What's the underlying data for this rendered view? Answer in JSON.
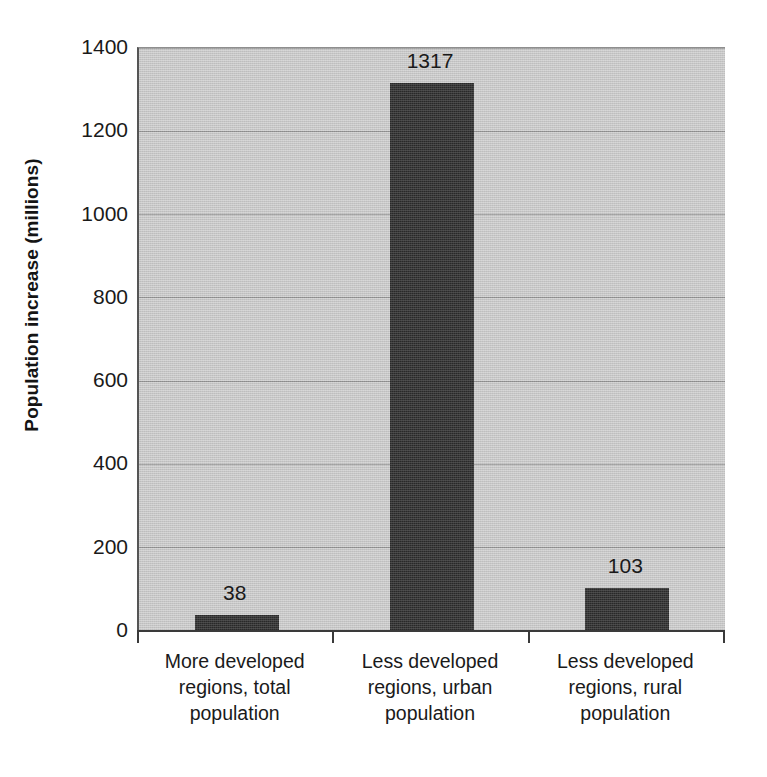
{
  "chart_data": {
    "type": "bar",
    "title": "",
    "subtitle": "",
    "xlabel": "",
    "ylabel": "Population increase (millions)",
    "categories": [
      "More developed regions, total population",
      "Less developed regions, urban population",
      "Less developed regions, rural population"
    ],
    "category_lines": [
      [
        "More developed",
        "regions, total",
        "population"
      ],
      [
        "Less developed",
        "regions, urban",
        "population"
      ],
      [
        "Less developed",
        "regions, rural",
        "population"
      ]
    ],
    "values": [
      38,
      1317,
      103
    ],
    "value_labels": [
      "38",
      "1317",
      "103"
    ],
    "ylim": [
      0,
      1400
    ],
    "ytick_values": [
      0,
      200,
      400,
      600,
      800,
      1000,
      1200,
      1400
    ],
    "ytick_labels": [
      "0",
      "200",
      "400",
      "600",
      "800",
      "1000",
      "1200",
      "1400"
    ],
    "grid": true,
    "grid_axis": "y",
    "legend": false,
    "legend_position": "none",
    "colors": {
      "bar": "#111111",
      "plot_background": "#c9c9c9",
      "gridline": "#8b8b8b",
      "axis": "#3a3a3a",
      "text": "#1a1a1a",
      "figure_background": "#ffffff"
    }
  }
}
